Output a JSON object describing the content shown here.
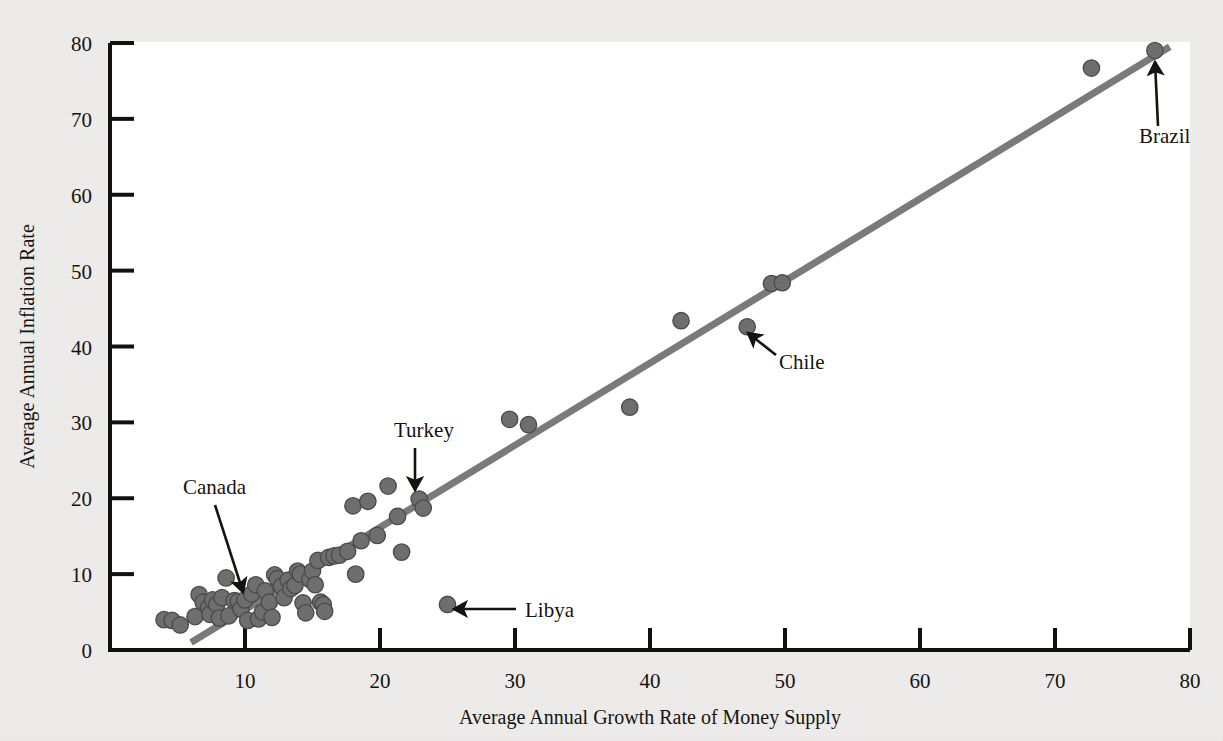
{
  "figure": {
    "paper_color": "#efeeec",
    "plot_background": "#ffffff",
    "axis_color": "#121110",
    "point_color": "#6e6e6e",
    "point_edge_color": "#4a4a4a",
    "trendline_color": "#7a7a7a",
    "annotation_color": "#16130f"
  },
  "chart_data": {
    "type": "scatter",
    "title": "",
    "xlabel": "Average Annual Growth Rate of Money Supply",
    "ylabel": "Average Annual Inflation Rate",
    "xlim": [
      0,
      80
    ],
    "ylim": [
      0,
      80
    ],
    "xticks": [
      0,
      10,
      20,
      30,
      40,
      50,
      60,
      70,
      80
    ],
    "yticks": [
      0,
      10,
      20,
      30,
      40,
      50,
      60,
      70,
      80
    ],
    "xtick_labels": [
      "",
      "10",
      "20",
      "30",
      "40",
      "50",
      "60",
      "70",
      "80"
    ],
    "ytick_labels": [
      "0",
      "10",
      "20",
      "30",
      "40",
      "50",
      "60",
      "70",
      "80"
    ],
    "grid": false,
    "legend": "none",
    "trendline": {
      "type": "linear",
      "x_start": 6.0,
      "y_start": 1.0,
      "x_end": 78.5,
      "y_end": 79.5
    },
    "points": [
      {
        "x": 4.0,
        "y": 4.0
      },
      {
        "x": 4.6,
        "y": 3.9
      },
      {
        "x": 5.2,
        "y": 3.3
      },
      {
        "x": 6.3,
        "y": 4.4
      },
      {
        "x": 6.6,
        "y": 7.3
      },
      {
        "x": 6.9,
        "y": 6.3
      },
      {
        "x": 7.3,
        "y": 5.6
      },
      {
        "x": 7.4,
        "y": 4.7
      },
      {
        "x": 7.6,
        "y": 6.6
      },
      {
        "x": 7.9,
        "y": 6.0
      },
      {
        "x": 8.1,
        "y": 4.2
      },
      {
        "x": 8.3,
        "y": 6.9
      },
      {
        "x": 8.6,
        "y": 9.5
      },
      {
        "x": 8.8,
        "y": 4.5
      },
      {
        "x": 9.2,
        "y": 6.5
      },
      {
        "x": 9.5,
        "y": 6.4
      },
      {
        "x": 9.7,
        "y": 5.4
      },
      {
        "x": 10.0,
        "y": 6.6
      },
      {
        "x": 10.2,
        "y": 3.9
      },
      {
        "x": 10.5,
        "y": 7.4
      },
      {
        "x": 10.8,
        "y": 8.6
      },
      {
        "x": 11.0,
        "y": 4.1
      },
      {
        "x": 11.3,
        "y": 5.0
      },
      {
        "x": 11.5,
        "y": 7.8
      },
      {
        "x": 11.8,
        "y": 6.3
      },
      {
        "x": 12.0,
        "y": 4.3
      },
      {
        "x": 12.2,
        "y": 9.9
      },
      {
        "x": 12.4,
        "y": 9.4
      },
      {
        "x": 12.7,
        "y": 8.4
      },
      {
        "x": 12.9,
        "y": 6.9
      },
      {
        "x": 13.2,
        "y": 9.2
      },
      {
        "x": 13.4,
        "y": 8.1
      },
      {
        "x": 13.7,
        "y": 8.5
      },
      {
        "x": 13.9,
        "y": 10.4
      },
      {
        "x": 14.1,
        "y": 10.0
      },
      {
        "x": 14.3,
        "y": 6.2
      },
      {
        "x": 14.5,
        "y": 4.9
      },
      {
        "x": 14.8,
        "y": 9.3
      },
      {
        "x": 15.0,
        "y": 10.4
      },
      {
        "x": 15.2,
        "y": 8.6
      },
      {
        "x": 15.4,
        "y": 11.8
      },
      {
        "x": 15.6,
        "y": 6.3
      },
      {
        "x": 15.8,
        "y": 6.0
      },
      {
        "x": 15.9,
        "y": 5.1
      },
      {
        "x": 16.2,
        "y": 12.2
      },
      {
        "x": 16.6,
        "y": 12.4
      },
      {
        "x": 17.0,
        "y": 12.5
      },
      {
        "x": 17.6,
        "y": 13.0
      },
      {
        "x": 18.0,
        "y": 19.0
      },
      {
        "x": 18.2,
        "y": 10.0
      },
      {
        "x": 18.6,
        "y": 14.4
      },
      {
        "x": 19.1,
        "y": 19.6
      },
      {
        "x": 19.8,
        "y": 15.1
      },
      {
        "x": 20.6,
        "y": 21.6
      },
      {
        "x": 21.3,
        "y": 17.6
      },
      {
        "x": 21.6,
        "y": 12.9
      },
      {
        "x": 22.9,
        "y": 19.9
      },
      {
        "x": 23.2,
        "y": 18.7
      },
      {
        "x": 25.0,
        "y": 6.0
      },
      {
        "x": 29.6,
        "y": 30.4
      },
      {
        "x": 31.0,
        "y": 29.7
      },
      {
        "x": 38.5,
        "y": 32.0
      },
      {
        "x": 42.3,
        "y": 43.4
      },
      {
        "x": 47.2,
        "y": 42.6
      },
      {
        "x": 49.0,
        "y": 48.3
      },
      {
        "x": 49.8,
        "y": 48.4
      },
      {
        "x": 72.7,
        "y": 76.7
      },
      {
        "x": 77.4,
        "y": 79.0
      }
    ],
    "annotations": [
      {
        "label": "Canada",
        "label_x": 183,
        "label_y": 494,
        "arrow_from_x": 215,
        "arrow_from_y": 505,
        "arrow_to_x": 243,
        "arrow_to_y": 592,
        "point": {
          "x": 8.6,
          "y": 6.8
        }
      },
      {
        "label": "Turkey",
        "label_x": 394,
        "label_y": 437,
        "arrow_from_x": 415,
        "arrow_from_y": 448,
        "arrow_to_x": 415,
        "arrow_to_y": 490,
        "point": {
          "x": 22.9,
          "y": 19.9
        }
      },
      {
        "label": "Chile",
        "label_x": 779,
        "label_y": 369,
        "arrow_from_x": 776,
        "arrow_from_y": 355,
        "arrow_to_x": 748,
        "arrow_to_y": 333,
        "point": {
          "x": 47.2,
          "y": 42.6
        }
      },
      {
        "label": "Brazil",
        "label_x": 1139,
        "label_y": 143,
        "arrow_from_x": 1158,
        "arrow_from_y": 126,
        "arrow_to_x": 1155,
        "arrow_to_y": 62,
        "point": {
          "x": 77.4,
          "y": 79.0
        }
      },
      {
        "label": "Libya",
        "label_x": 525,
        "label_y": 617,
        "arrow_from_x": 516,
        "arrow_from_y": 609,
        "arrow_to_x": 454,
        "arrow_to_y": 609,
        "point": {
          "x": 25.0,
          "y": 6.0
        }
      }
    ]
  }
}
